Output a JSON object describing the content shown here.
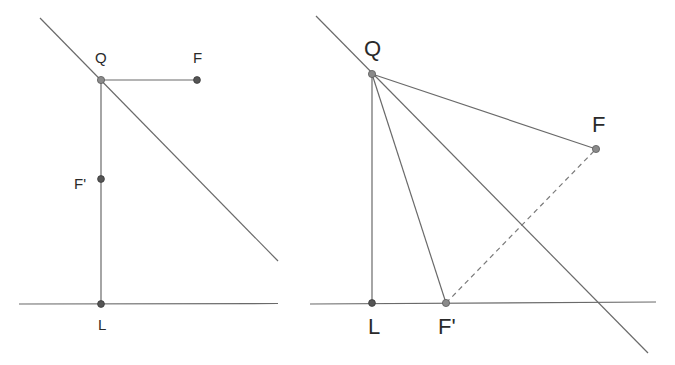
{
  "diagrams": [
    {
      "id": "left",
      "points": {
        "Q": {
          "label": "Q",
          "x": 101,
          "y": 80
        },
        "F": {
          "label": "F",
          "x": 197,
          "y": 80
        },
        "F_prime": {
          "label": "F'",
          "x": 101,
          "y": 179
        },
        "L": {
          "label": "L",
          "x": 101,
          "y": 304
        }
      },
      "lines": [
        {
          "name": "tangent-line",
          "style": "solid"
        },
        {
          "name": "directrix",
          "style": "solid"
        },
        {
          "name": "segment-QF",
          "style": "solid"
        },
        {
          "name": "segment-QL",
          "style": "solid"
        }
      ]
    },
    {
      "id": "right",
      "points": {
        "Q": {
          "label": "Q",
          "x": 372,
          "y": 74
        },
        "F": {
          "label": "F",
          "x": 596,
          "y": 149
        },
        "F_prime": {
          "label": "F'",
          "x": 446,
          "y": 303
        },
        "L": {
          "label": "L",
          "x": 372,
          "y": 303
        }
      },
      "lines": [
        {
          "name": "tangent-line",
          "style": "solid"
        },
        {
          "name": "directrix",
          "style": "solid"
        },
        {
          "name": "segment-QF",
          "style": "solid"
        },
        {
          "name": "segment-QL",
          "style": "solid"
        },
        {
          "name": "segment-QF-prime",
          "style": "solid"
        },
        {
          "name": "segment-F-prime-F",
          "style": "dashed"
        }
      ]
    }
  ],
  "colors": {
    "line": "#6a6a6a",
    "point_dark": "#555555",
    "point_light": "#8a8a8a",
    "label": "#2a2a2a"
  }
}
